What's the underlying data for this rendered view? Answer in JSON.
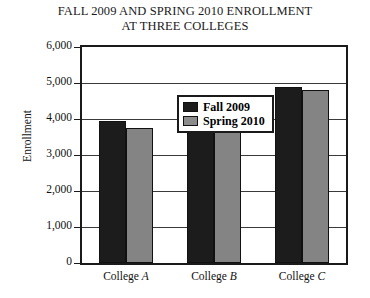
{
  "chart_data": {
    "type": "bar",
    "title": "FALL 2009 AND SPRING 2010 ENROLLMENT AT THREE COLLEGES",
    "title_line1": "FALL 2009 AND SPRING 2010 ENROLLMENT",
    "title_line2": "AT THREE COLLEGES",
    "xlabel": "",
    "ylabel": "Enrollment",
    "categories": [
      "College A",
      "College B",
      "College C"
    ],
    "category_parts": [
      {
        "word": "College",
        "letter": "A"
      },
      {
        "word": "College",
        "letter": "B"
      },
      {
        "word": "College",
        "letter": "C"
      }
    ],
    "series": [
      {
        "name": "Fall 2009",
        "color": "#1c1c1c",
        "values": [
          3950,
          4500,
          4900
        ]
      },
      {
        "name": "Spring 2010",
        "color": "#848484",
        "values": [
          3750,
          3700,
          4800
        ]
      }
    ],
    "ylim": [
      0,
      6000
    ],
    "ytick_step": 1000,
    "ytick_labels": [
      "6,000",
      "5,000",
      "4,000",
      "3,000",
      "2,000",
      "1,000",
      "0"
    ],
    "ytick_values": [
      6000,
      5000,
      4000,
      3000,
      2000,
      1000,
      0
    ],
    "grid": true,
    "legend_position": "top-left-inside"
  },
  "legend": {
    "items": [
      {
        "label": "Fall 2009",
        "swatch": "fall"
      },
      {
        "label": "Spring 2010",
        "swatch": "spring"
      }
    ]
  }
}
